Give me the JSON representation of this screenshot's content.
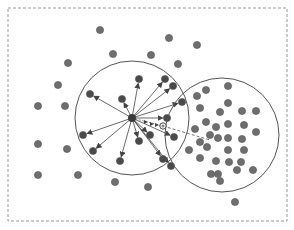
{
  "diagram": {
    "type": "mean-shift-illustration",
    "colors": {
      "background": "#ffffff",
      "frame": "#999999",
      "point": "#6e6e6e",
      "point_stroke": "#555555",
      "inner_point": "#4a4a4a",
      "circle": "#555555",
      "arrow": "#444444",
      "mean_marker": "#888888",
      "shift_line": "#777777"
    },
    "frame": {
      "x": 8,
      "y": 8,
      "width": 279,
      "height": 213
    },
    "window_left": {
      "cx": 132,
      "cy": 118,
      "r": 57
    },
    "window_right": {
      "cx": 222,
      "cy": 135,
      "r": 57
    },
    "center_point": {
      "x": 132,
      "y": 118
    },
    "mean_point": {
      "x": 163,
      "y": 126
    },
    "shift_target": {
      "x": 210,
      "y": 140
    },
    "outer_points": [
      [
        100,
        30
      ],
      [
        169,
        38
      ],
      [
        197,
        45
      ],
      [
        113,
        54
      ],
      [
        151,
        55
      ],
      [
        68,
        63
      ],
      [
        178,
        64
      ],
      [
        58,
        85
      ],
      [
        38,
        106
      ],
      [
        65,
        106
      ],
      [
        38,
        144
      ],
      [
        67,
        149
      ],
      [
        38,
        175
      ],
      [
        78,
        175
      ],
      [
        115,
        182
      ],
      [
        148,
        187
      ],
      [
        235,
        202
      ]
    ],
    "inner_points": [
      [
        139,
        79
      ],
      [
        165,
        79
      ],
      [
        173,
        86
      ],
      [
        90,
        94
      ],
      [
        122,
        99
      ],
      [
        182,
        102
      ],
      [
        167,
        118
      ],
      [
        174,
        137
      ],
      [
        83,
        135
      ],
      [
        150,
        135
      ],
      [
        139,
        141
      ],
      [
        93,
        151
      ],
      [
        120,
        161
      ],
      [
        163,
        159
      ],
      [
        171,
        166
      ]
    ],
    "cluster_points": [
      [
        197,
        96
      ],
      [
        206,
        90
      ],
      [
        228,
        86
      ],
      [
        200,
        108
      ],
      [
        228,
        103
      ],
      [
        220,
        112
      ],
      [
        242,
        111
      ],
      [
        256,
        111
      ],
      [
        195,
        129
      ],
      [
        206,
        122
      ],
      [
        216,
        127
      ],
      [
        228,
        124
      ],
      [
        244,
        125
      ],
      [
        256,
        132
      ],
      [
        210,
        135
      ],
      [
        200,
        142
      ],
      [
        218,
        138
      ],
      [
        228,
        138
      ],
      [
        242,
        139
      ],
      [
        189,
        150
      ],
      [
        207,
        147
      ],
      [
        228,
        150
      ],
      [
        244,
        150
      ],
      [
        200,
        158
      ],
      [
        216,
        161
      ],
      [
        229,
        162
      ],
      [
        241,
        162
      ],
      [
        218,
        174
      ],
      [
        237,
        170
      ],
      [
        253,
        170
      ],
      [
        211,
        174
      ],
      [
        220,
        181
      ]
    ]
  }
}
